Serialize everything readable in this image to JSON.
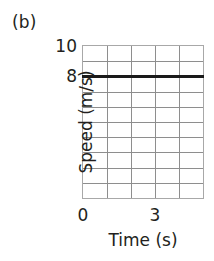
{
  "panel": {
    "label": "(b)"
  },
  "chart_data": {
    "type": "line",
    "title": "(b)",
    "xlabel": "Time (s)",
    "ylabel": "Speed (m/s)",
    "xlim": [
      0,
      5
    ],
    "ylim": [
      0,
      10
    ],
    "xticks": [
      0,
      3
    ],
    "xtick_labels": [
      "0",
      "3"
    ],
    "yticks": [
      8,
      10
    ],
    "ytick_labels": [
      "8",
      "10"
    ],
    "grid": true,
    "grid_columns": 5,
    "grid_rows": 10,
    "grid_color": "#8e8e8e",
    "legend": null,
    "series": [
      {
        "name": "Speed",
        "color": "#1a1a1a",
        "line_width": 3,
        "x": [
          0,
          5
        ],
        "values": [
          8,
          8
        ],
        "description": "constant speed of 8 m/s"
      }
    ]
  }
}
